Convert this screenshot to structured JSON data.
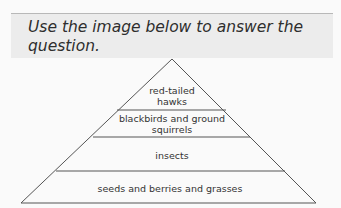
{
  "prompt": {
    "text": "Use the image below to answer the question."
  },
  "pyramid": {
    "levels": [
      {
        "label_line1": "red-tailed",
        "label_line2": "hawks"
      },
      {
        "label_line1": "blackbirds and ground",
        "label_line2": "squirrels"
      },
      {
        "label_line1": "insects"
      },
      {
        "label_line1": "seeds and berries and grasses"
      }
    ]
  }
}
